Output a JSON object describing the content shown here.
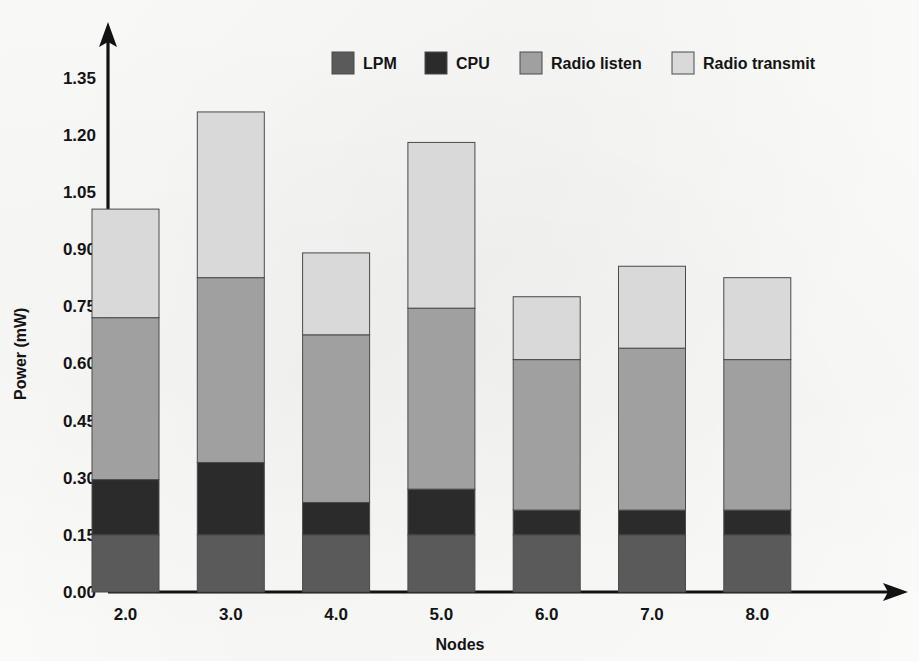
{
  "chart_data": {
    "type": "bar",
    "variant": "stacked",
    "title": "",
    "xlabel": "Nodes",
    "ylabel": "Power (mW)",
    "categories": [
      "2.0",
      "3.0",
      "4.0",
      "5.0",
      "6.0",
      "7.0",
      "8.0"
    ],
    "ylim": [
      0.0,
      1.4
    ],
    "yticks": [
      0.0,
      0.15,
      0.3,
      0.45,
      0.6,
      0.75,
      0.9,
      1.05,
      1.2,
      1.35
    ],
    "ytick_labels": [
      "0.00",
      "0.15",
      "0.30",
      "0.45",
      "0.60",
      "0.75",
      "0.90",
      "1.05",
      "1.20",
      "1.35"
    ],
    "grid": false,
    "legend_position": "top-center",
    "series": [
      {
        "name": "LPM",
        "color": "#5a5a5a",
        "values": [
          0.15,
          0.15,
          0.15,
          0.15,
          0.15,
          0.15,
          0.15
        ]
      },
      {
        "name": "CPU",
        "color": "#2b2b2b",
        "values": [
          0.145,
          0.19,
          0.085,
          0.12,
          0.065,
          0.065,
          0.065
        ]
      },
      {
        "name": "Radio listen",
        "color": "#a0a0a0",
        "values": [
          0.425,
          0.485,
          0.44,
          0.475,
          0.395,
          0.425,
          0.395
        ]
      },
      {
        "name": "Radio transmit",
        "color": "#d9d9d9",
        "values": [
          0.285,
          0.435,
          0.215,
          0.435,
          0.165,
          0.215,
          0.215
        ]
      }
    ],
    "totals": [
      1.005,
      1.26,
      0.89,
      1.18,
      0.775,
      0.855,
      0.825
    ]
  },
  "axes": {
    "y_axis_title": "Power (mW)",
    "x_axis_title": "Nodes"
  },
  "legend": {
    "items": [
      {
        "label": "LPM",
        "color": "#5a5a5a"
      },
      {
        "label": "CPU",
        "color": "#2b2b2b"
      },
      {
        "label": "Radio listen",
        "color": "#a0a0a0"
      },
      {
        "label": "Radio transmit",
        "color": "#d9d9d9"
      }
    ]
  }
}
